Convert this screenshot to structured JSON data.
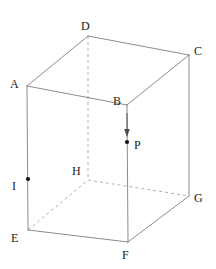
{
  "figure": {
    "kind": "3d-rectangular-prism-diagram",
    "title": "",
    "colors": {
      "background": "#ffffff",
      "solid_edge": "#6e6e6e",
      "hidden_edge": "#9a9a9a",
      "arrow": "#4a4a4a",
      "point": "#111111",
      "label": "#1a1a1a"
    },
    "style": {
      "solid_edge_width": 0.8,
      "hidden_edge_width": 0.8,
      "hidden_edge_dash": "3,3",
      "point_radius": 2.1,
      "label_font_size": 12
    },
    "vertices": [
      {
        "name": "A",
        "x": 27,
        "y": 86,
        "label_x": 10,
        "label_y": 78,
        "hidden": false
      },
      {
        "name": "B",
        "x": 127,
        "y": 105,
        "label_x": 113,
        "label_y": 95,
        "hidden": false
      },
      {
        "name": "C",
        "x": 189,
        "y": 55,
        "label_x": 194,
        "label_y": 45,
        "hidden": false
      },
      {
        "name": "D",
        "x": 88,
        "y": 36,
        "label_x": 81,
        "label_y": 20,
        "hidden": false
      },
      {
        "name": "E",
        "x": 28,
        "y": 230,
        "label_x": 11,
        "label_y": 232,
        "hidden": false
      },
      {
        "name": "F",
        "x": 128,
        "y": 242,
        "label_x": 122,
        "label_y": 249,
        "hidden": false
      },
      {
        "name": "G",
        "x": 189,
        "y": 196,
        "label_x": 194,
        "label_y": 192,
        "hidden": false
      },
      {
        "name": "H",
        "x": 88,
        "y": 180,
        "label_x": 72,
        "label_y": 165,
        "hidden": true
      }
    ],
    "solid_edges": [
      {
        "name": "edge-AD",
        "from": "A",
        "to": "D"
      },
      {
        "name": "edge-DC",
        "from": "D",
        "to": "C"
      },
      {
        "name": "edge-AB",
        "from": "A",
        "to": "B"
      },
      {
        "name": "edge-BC",
        "from": "B",
        "to": "C"
      },
      {
        "name": "edge-AE",
        "from": "A",
        "to": "E"
      },
      {
        "name": "edge-BF",
        "from": "B",
        "to": "F"
      },
      {
        "name": "edge-CG",
        "from": "C",
        "to": "G"
      },
      {
        "name": "edge-EF",
        "from": "E",
        "to": "F"
      },
      {
        "name": "edge-FG",
        "from": "F",
        "to": "G"
      }
    ],
    "hidden_edges": [
      {
        "name": "edge-DH",
        "from": "D",
        "to": "H"
      },
      {
        "name": "edge-EH",
        "from": "E",
        "to": "H"
      },
      {
        "name": "edge-HG",
        "from": "H",
        "to": "G"
      }
    ],
    "marked_points": [
      {
        "name": "P",
        "x": 127,
        "y": 142,
        "label_x": 134,
        "label_y": 139,
        "on_edge": "edge-BF"
      },
      {
        "name": "I",
        "x": 28,
        "y": 179,
        "label_x": 12,
        "label_y": 180,
        "on_edge": "edge-AE"
      }
    ],
    "arrow": {
      "name": "downward-arrow",
      "x": 127,
      "y_start": 113,
      "y_end": 136,
      "head_width": 5,
      "head_length": 7,
      "direction": "down"
    }
  }
}
